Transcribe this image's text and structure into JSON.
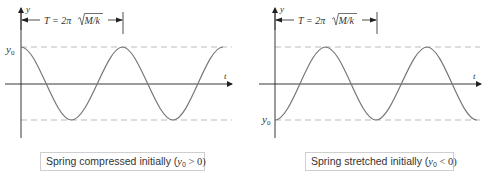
{
  "figure": {
    "panels": [
      {
        "id": "compressed",
        "y_axis_label": "y",
        "t_axis_label": "t",
        "y0_label": "y",
        "y0_sub": "0",
        "period_label": "T = 2π√M/k",
        "period_prefix": "T = 2π",
        "period_radicand": "M/k",
        "caption_text": "Spring compressed initially (",
        "caption_var": "y",
        "caption_sub": "0",
        "caption_rel": " > 0)",
        "initial_position": "max",
        "caption": "Spring compressed initially (y0 > 0)"
      },
      {
        "id": "stretched",
        "y_axis_label": "y",
        "t_axis_label": "t",
        "y0_label": "y",
        "y0_sub": "0",
        "period_label": "T = 2π√M/k",
        "period_prefix": "T = 2π",
        "period_radicand": "M/k",
        "caption_text": "Spring stretched initially (",
        "caption_var": "y",
        "caption_sub": "0",
        "caption_rel": " < 0)",
        "initial_position": "min",
        "caption": "Spring stretched initially (y0 < 0)"
      }
    ],
    "colors": {
      "curve": "#777777",
      "axis": "#222222",
      "dashed": "#aaaaaa",
      "text": "#333333"
    }
  }
}
